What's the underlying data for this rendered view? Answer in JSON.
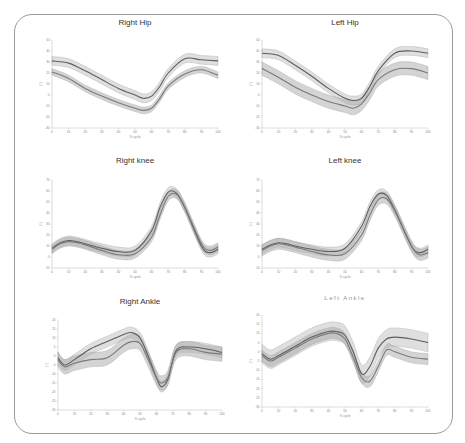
{
  "figure": {
    "frame_color": "#9a9a9a",
    "line_color": "#6a6a6a",
    "band_color": "#bdbdbd",
    "band_opacity": 0.55,
    "x_label": "% cycle",
    "y_label": "(°)"
  },
  "chart_data": [
    {
      "type": "line",
      "title": "Right Hip",
      "xlabel": "% cycle",
      "ylabel": "(°)",
      "xlim": [
        0,
        100
      ],
      "ylim": [
        -30,
        50
      ],
      "yticks": [
        50,
        40,
        30,
        20,
        10,
        0,
        -10,
        -20,
        -30
      ],
      "xticks": [
        0,
        10,
        20,
        30,
        40,
        50,
        60,
        70,
        80,
        90,
        100
      ],
      "grid": false,
      "box": {
        "x": 52,
        "y": 40,
        "w": 166,
        "h": 88,
        "title_y": 25
      },
      "x": [
        0,
        10,
        20,
        30,
        40,
        50,
        55,
        60,
        65,
        70,
        80,
        90,
        100
      ],
      "series": [
        {
          "name": "Mean A",
          "values": [
            31,
            29,
            22,
            14,
            6,
            0,
            -3,
            -1,
            8,
            20,
            33,
            32,
            31
          ],
          "sd": 4
        },
        {
          "name": "Mean B",
          "values": [
            21,
            15,
            6,
            -1,
            -7,
            -12,
            -14,
            -12,
            -3,
            8,
            19,
            23,
            18
          ],
          "sd": 3
        }
      ]
    },
    {
      "type": "line",
      "title": "Left Hip",
      "xlabel": "% cycle",
      "ylabel": "(°)",
      "xlim": [
        0,
        100
      ],
      "ylim": [
        -30,
        50
      ],
      "yticks": [
        50,
        40,
        30,
        20,
        10,
        0,
        -10,
        -20,
        -30
      ],
      "xticks": [
        0,
        10,
        20,
        30,
        40,
        50,
        60,
        70,
        80,
        90,
        100
      ],
      "grid": false,
      "box": {
        "x": 262,
        "y": 40,
        "w": 166,
        "h": 88,
        "title_y": 25
      },
      "x": [
        0,
        10,
        20,
        30,
        40,
        50,
        55,
        60,
        65,
        70,
        80,
        90,
        100
      ],
      "series": [
        {
          "name": "Mean A",
          "values": [
            38,
            36,
            27,
            17,
            6,
            -3,
            -5,
            -3,
            8,
            22,
            38,
            40,
            38
          ],
          "sd": 4
        },
        {
          "name": "Mean B",
          "values": [
            24,
            16,
            7,
            0,
            -6,
            -10,
            -12,
            -8,
            2,
            14,
            23,
            24,
            20
          ],
          "sd": 6
        }
      ]
    },
    {
      "type": "line",
      "title": "Right knee",
      "xlabel": "% cycle",
      "ylabel": "(°)",
      "xlim": [
        0,
        100
      ],
      "ylim": [
        -10,
        70
      ],
      "yticks": [
        70,
        60,
        50,
        40,
        30,
        20,
        10,
        0,
        -10
      ],
      "xticks": [
        0,
        10,
        20,
        30,
        40,
        50,
        60,
        70,
        80,
        90,
        100
      ],
      "grid": false,
      "box": {
        "x": 52,
        "y": 180,
        "w": 166,
        "h": 88,
        "title_y": 163
      },
      "x": [
        0,
        5,
        10,
        15,
        20,
        30,
        40,
        50,
        60,
        65,
        70,
        75,
        80,
        90,
        95,
        100
      ],
      "series": [
        {
          "name": "Mean A",
          "values": [
            8,
            13,
            15,
            14,
            12,
            8,
            5,
            6,
            24,
            45,
            59,
            58,
            45,
            10,
            4,
            7
          ],
          "sd": 4
        },
        {
          "name": "Mean B",
          "values": [
            7,
            12,
            14,
            13,
            11,
            6,
            2,
            3,
            18,
            38,
            55,
            57,
            45,
            12,
            6,
            9
          ],
          "sd": 4
        }
      ]
    },
    {
      "type": "line",
      "title": "Left knee",
      "xlabel": "% cycle",
      "ylabel": "(°)",
      "xlim": [
        0,
        100
      ],
      "ylim": [
        -10,
        70
      ],
      "yticks": [
        70,
        60,
        50,
        40,
        30,
        20,
        10,
        0,
        -10
      ],
      "xticks": [
        0,
        10,
        20,
        30,
        40,
        50,
        60,
        70,
        80,
        90,
        100
      ],
      "grid": false,
      "box": {
        "x": 262,
        "y": 180,
        "w": 166,
        "h": 88,
        "title_y": 163
      },
      "x": [
        0,
        5,
        10,
        15,
        20,
        30,
        40,
        50,
        60,
        65,
        70,
        75,
        80,
        90,
        95,
        100
      ],
      "series": [
        {
          "name": "Mean A",
          "values": [
            7,
            11,
            13,
            12,
            10,
            7,
            5,
            8,
            28,
            46,
            57,
            56,
            43,
            10,
            4,
            7
          ],
          "sd": 4
        },
        {
          "name": "Mean B",
          "values": [
            6,
            10,
            12,
            11,
            9,
            5,
            2,
            3,
            20,
            38,
            52,
            53,
            42,
            10,
            2,
            4
          ],
          "sd": 5
        }
      ]
    },
    {
      "type": "line",
      "title": "Right Ankle",
      "xlabel": "% cycle",
      "ylabel": "(°)",
      "xlim": [
        0,
        100
      ],
      "ylim": [
        -30,
        20
      ],
      "yticks": [
        20,
        15,
        10,
        5,
        0,
        -5,
        -10,
        -15,
        -20,
        -25,
        -30
      ],
      "xticks": [
        0,
        10,
        20,
        30,
        40,
        50,
        60,
        70,
        80,
        90,
        100
      ],
      "grid": false,
      "box": {
        "x": 58,
        "y": 320,
        "w": 164,
        "h": 90,
        "title_y": 304
      },
      "x": [
        0,
        4,
        10,
        20,
        30,
        40,
        45,
        50,
        55,
        60,
        63,
        67,
        72,
        80,
        90,
        100
      ],
      "series": [
        {
          "name": "Mean A",
          "values": [
            -1,
            -5,
            -2,
            4,
            8,
            12,
            13,
            10,
            0,
            -12,
            -17,
            -13,
            3,
            5,
            4,
            2
          ],
          "sd": 3
        },
        {
          "name": "Mean B",
          "values": [
            -2,
            -6,
            -4,
            -2,
            -1,
            6,
            8,
            7,
            -2,
            -12,
            -15,
            -12,
            2,
            4,
            2,
            1
          ],
          "sd": 4
        }
      ]
    },
    {
      "type": "line",
      "title": "Left Ankle",
      "xlabel": "% cycle",
      "ylabel": "(°)",
      "xlim": [
        0,
        100
      ],
      "ylim": [
        -30,
        20
      ],
      "yticks": [
        20,
        15,
        10,
        5,
        0,
        -5,
        -10,
        -15,
        -20,
        -25,
        -30
      ],
      "xticks": [
        0,
        10,
        20,
        30,
        40,
        50,
        60,
        70,
        80,
        90,
        100
      ],
      "grid": false,
      "box": {
        "x": 262,
        "y": 315,
        "w": 166,
        "h": 92,
        "title_y": 300
      },
      "x": [
        0,
        5,
        10,
        20,
        30,
        40,
        45,
        50,
        55,
        60,
        65,
        70,
        75,
        80,
        90,
        100
      ],
      "series": [
        {
          "name": "Mean A",
          "values": [
            -1,
            -4,
            -2,
            3,
            8,
            11,
            11,
            9,
            0,
            -12,
            -8,
            2,
            7,
            8,
            7,
            5
          ],
          "sd": 5
        },
        {
          "name": "Mean B",
          "values": [
            -2,
            -5,
            -3,
            2,
            7,
            10,
            10,
            7,
            -3,
            -14,
            -16,
            -8,
            1,
            0,
            -3,
            -4
          ],
          "sd": 3
        }
      ]
    }
  ]
}
